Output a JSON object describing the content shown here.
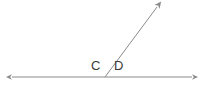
{
  "figure": {
    "canvas": {
      "width": 202,
      "height": 99,
      "background_color": "#ffffff"
    },
    "stroke_color": "#8a8a8a",
    "label_color": "#3a3a3a",
    "stroke_width": 1,
    "vertex": {
      "name": "vertex-point",
      "x": 105,
      "y": 77
    },
    "labels": [
      {
        "id": "label-c",
        "text": "C",
        "x": 91,
        "y": 59,
        "describes": "angle left of ray, above baseline"
      },
      {
        "id": "label-d",
        "text": "D",
        "x": 114,
        "y": 59,
        "describes": "angle right of ray, above baseline"
      }
    ],
    "elements": [
      {
        "id": "baseline",
        "kind": "double-headed-line",
        "x1": 12,
        "y1": 77,
        "x2": 192,
        "y2": 77
      },
      {
        "id": "ray",
        "kind": "single-headed-ray",
        "x1": 105,
        "y1": 77,
        "x2": 158,
        "y2": 6
      }
    ],
    "arrowheads": [
      {
        "id": "arrow-left",
        "tip_x": 12,
        "tip_y": 77
      },
      {
        "id": "arrow-right",
        "tip_x": 192,
        "tip_y": 77
      },
      {
        "id": "arrow-ray",
        "tip_x": 158,
        "tip_y": 6
      }
    ]
  }
}
